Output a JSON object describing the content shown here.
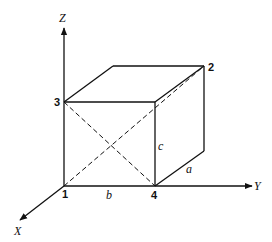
{
  "axes": {
    "x": "X",
    "y": "Y",
    "z": "Z"
  },
  "vertices": {
    "v1": "1",
    "v2": "2",
    "v3": "3",
    "v4": "4"
  },
  "edges": {
    "a": "a",
    "b": "b",
    "c": "c"
  },
  "colors": {
    "line": "#111111",
    "background": "#ffffff"
  }
}
